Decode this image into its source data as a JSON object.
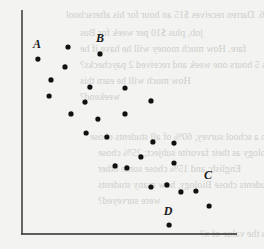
{
  "chart_data": {
    "type": "scatter",
    "title": "",
    "xlabel": "",
    "ylabel": "",
    "xlim": [
      0,
      100
    ],
    "ylim": [
      0,
      100
    ],
    "grid": false,
    "legend": null,
    "axes_px": {
      "x0": 22,
      "x1": 237,
      "y0": 234,
      "y1": 10
    },
    "points": [
      {
        "x": 7.4,
        "y": 78.1,
        "label": "A"
      },
      {
        "x": 21.4,
        "y": 83.5
      },
      {
        "x": 36.3,
        "y": 80.4,
        "label": "B"
      },
      {
        "x": 20.0,
        "y": 74.6
      },
      {
        "x": 13.5,
        "y": 68.8
      },
      {
        "x": 31.6,
        "y": 65.6
      },
      {
        "x": 47.9,
        "y": 65.2
      },
      {
        "x": 12.6,
        "y": 61.6
      },
      {
        "x": 29.3,
        "y": 58.9
      },
      {
        "x": 60.0,
        "y": 59.4
      },
      {
        "x": 22.8,
        "y": 53.6
      },
      {
        "x": 35.3,
        "y": 51.3
      },
      {
        "x": 47.9,
        "y": 53.6
      },
      {
        "x": 29.8,
        "y": 45.1
      },
      {
        "x": 39.5,
        "y": 43.3
      },
      {
        "x": 60.9,
        "y": 41.1
      },
      {
        "x": 70.7,
        "y": 40.6
      },
      {
        "x": 55.3,
        "y": 34.4
      },
      {
        "x": 70.7,
        "y": 31.7
      },
      {
        "x": 43.3,
        "y": 30.4
      },
      {
        "x": 48.8,
        "y": 29.5
      },
      {
        "x": 60.0,
        "y": 21.0
      },
      {
        "x": 67.4,
        "y": 21.9
      },
      {
        "x": 73.9,
        "y": 18.8
      },
      {
        "x": 80.9,
        "y": 19.2
      },
      {
        "x": 87.0,
        "y": 12.5,
        "label": "C"
      },
      {
        "x": 68.4,
        "y": 4.0,
        "label": "D"
      }
    ],
    "annotations": [
      {
        "text": "A",
        "x": 7.0,
        "y": 83.0
      },
      {
        "text": "B",
        "x": 36.3,
        "y": 85.7
      },
      {
        "text": "C",
        "x": 86.5,
        "y": 24.6
      },
      {
        "text": "D",
        "x": 67.9,
        "y": 8.5
      }
    ]
  },
  "bleed_through_text": [
    "6. Darren receives $15 an hour for his afterschool",
    "job, plus $10 per week for Bus",
    "fare. How much money will he have if he",
    "works 5 hours one week and received 2 paychecks?",
    "How much will he earn this",
    "weekend?",
    "a. In a school survey, 60% of all students chose",
    "Biology as their favorite subject; 25% chose",
    "English; and 15% chose some other",
    "subject. If 300 students chose Biology, how many students",
    "were surveyed?",
    "7. If 3x - 4 = 16, what is the value of x?"
  ]
}
